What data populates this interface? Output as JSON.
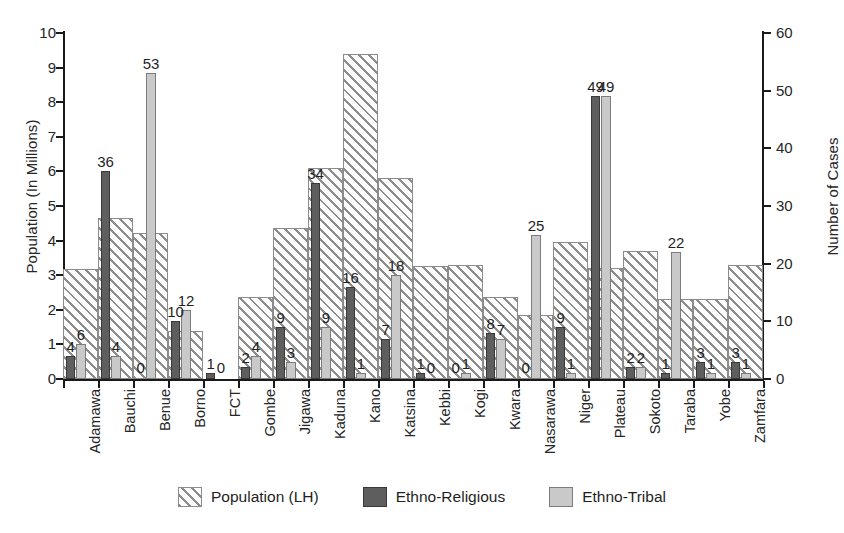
{
  "chart_data": {
    "type": "bar",
    "title": "",
    "subtitle": "",
    "xlabel": "",
    "ylabel": "Population (In Millions)",
    "ylabel_right": "Number of Cases",
    "ylim": [
      0,
      10
    ],
    "ylim_right": [
      0,
      60
    ],
    "yticks": [
      "0",
      "1",
      "2",
      "3",
      "4",
      "5",
      "6",
      "7",
      "8",
      "9",
      "10"
    ],
    "yticks_right": [
      "0",
      "10",
      "20",
      "30",
      "40",
      "50",
      "60"
    ],
    "grid": false,
    "legend_position": "bottom",
    "categories": [
      "Adamawa",
      "Bauchi",
      "Benue",
      "Borno",
      "FCT",
      "Gombe",
      "Jigawa",
      "Kaduna",
      "Kano",
      "Katsina",
      "Kebbi",
      "Kogi",
      "Kwara",
      "Nasarawa",
      "Niger",
      "Plateau",
      "Sokoto",
      "Taraba",
      "Yobe",
      "Zamfara"
    ],
    "series": [
      {
        "name": "Population (LH)",
        "axis": "left",
        "unit": "millions",
        "color": "#8d8d8d",
        "fill": "diagonal-hatch",
        "values": [
          3.18,
          4.65,
          4.22,
          1.38,
          0.0,
          2.37,
          4.37,
          6.1,
          9.4,
          5.8,
          3.28,
          3.3,
          2.37,
          1.86,
          3.95,
          3.2,
          3.7,
          2.3,
          2.3,
          3.3
        ],
        "labels": [
          "",
          "",
          "",
          "",
          "",
          "",
          "",
          "",
          "",
          "",
          "",
          "",
          "",
          "",
          "",
          "",
          "",
          "",
          "",
          ""
        ]
      },
      {
        "name": "Ethno-Religious",
        "axis": "right",
        "unit": "cases",
        "color": "#5e5e5e",
        "fill": "solid",
        "values": [
          4,
          36,
          0,
          10,
          1,
          2,
          9,
          34,
          16,
          7,
          1,
          0,
          8,
          0,
          9,
          49,
          2,
          1,
          3,
          3
        ],
        "labels": [
          "4",
          "36",
          "0",
          "10",
          "1",
          "2",
          "9",
          "34",
          "16",
          "7",
          "1",
          "0",
          "8",
          "0",
          "9",
          "49",
          "2",
          "1",
          "3",
          "3"
        ]
      },
      {
        "name": "Ethno-Tribal",
        "axis": "right",
        "unit": "cases",
        "color": "#c9c9c9",
        "fill": "solid",
        "values": [
          6,
          4,
          53,
          12,
          0,
          4,
          3,
          9,
          1,
          18,
          0,
          1,
          7,
          25,
          1,
          49,
          2,
          22,
          1,
          1
        ],
        "labels": [
          "6",
          "4",
          "53",
          "12",
          "0",
          "4",
          "3",
          "9",
          "1",
          "18",
          "0",
          "1",
          "7",
          "25",
          "1",
          "49",
          "2",
          "22",
          "1",
          "1"
        ]
      }
    ]
  },
  "legend": {
    "items": [
      {
        "label": "Population (LH)",
        "swatch": "hatch-swatch"
      },
      {
        "label": "Ethno-Religious",
        "swatch": "dark-swatch"
      },
      {
        "label": "Ethno-Tribal",
        "swatch": "light-swatch"
      }
    ]
  },
  "colors": {
    "population": "#8d8d8d",
    "ethno_religious": "#5e5e5e",
    "ethno_tribal": "#c9c9c9",
    "axis": "#1a1a1a",
    "background": "#ffffff"
  }
}
